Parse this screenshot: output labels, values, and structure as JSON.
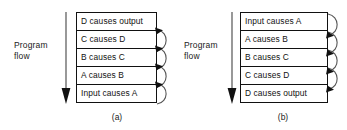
{
  "figure": {
    "width": 347,
    "height": 130,
    "background": "#ffffff",
    "ink_color": "#111111"
  },
  "panels": [
    {
      "id": "a",
      "caption": "(a)",
      "flow": {
        "label": "Program\nflow",
        "direction": "down",
        "arrow_icon": "down-arrow-icon"
      },
      "stack": {
        "rows": [
          {
            "text": "D causes output"
          },
          {
            "text": "C causes D"
          },
          {
            "text": "B causes C"
          },
          {
            "text": "A causes B"
          },
          {
            "text": "Input causes A"
          }
        ]
      },
      "arcs": {
        "count": 4,
        "side": "right",
        "direction": "upward",
        "description": "curved arrows looping from each lower statement boundary up to the statement above"
      }
    },
    {
      "id": "b",
      "caption": "(b)",
      "flow": {
        "label": "Program\nflow",
        "direction": "down",
        "arrow_icon": "down-arrow-icon"
      },
      "stack": {
        "rows": [
          {
            "text": "Input causes A"
          },
          {
            "text": "A causes B"
          },
          {
            "text": "B causes C"
          },
          {
            "text": "C causes D"
          },
          {
            "text": "D causes output"
          }
        ]
      },
      "arcs": {
        "count": 4,
        "side": "right",
        "direction": "downward",
        "description": "curved arrows looping from each statement boundary down to the statement below"
      }
    }
  ]
}
